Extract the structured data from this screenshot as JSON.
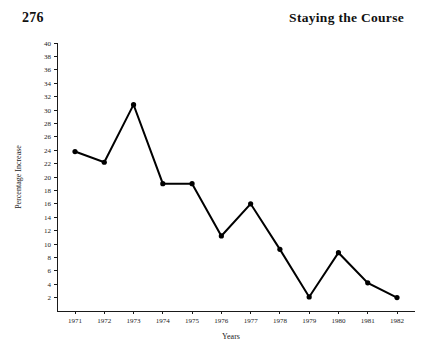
{
  "header": {
    "folio": "276",
    "running_head": "Staying the Course"
  },
  "chart_data": {
    "type": "line",
    "title": "",
    "xlabel": "Years",
    "ylabel": "Percentage Increase",
    "categories": [
      "1971",
      "1972",
      "1973",
      "1974",
      "1975",
      "1976",
      "1977",
      "1978",
      "1979",
      "1980",
      "1981",
      "1982"
    ],
    "values": [
      23.8,
      22.2,
      30.8,
      19.0,
      19.0,
      11.2,
      16.0,
      9.2,
      2.1,
      8.7,
      4.2,
      2.0
    ],
    "x": [
      1971,
      1972,
      1973,
      1974,
      1975,
      1976,
      1977,
      1978,
      1979,
      1980,
      1981,
      1982
    ],
    "ylim": [
      0,
      40
    ],
    "xlim": [
      1970.5,
      1982.5
    ],
    "ytick_labels": [
      "2",
      "4",
      "6",
      "8",
      "10",
      "12",
      "14",
      "16",
      "18",
      "20",
      "22",
      "24",
      "26",
      "28",
      "30",
      "32",
      "34",
      "36",
      "38",
      "40"
    ],
    "ytick_values": [
      2,
      4,
      6,
      8,
      10,
      12,
      14,
      16,
      18,
      20,
      22,
      24,
      26,
      28,
      30,
      32,
      34,
      36,
      38,
      40
    ],
    "ytick_step": 2,
    "grid": false,
    "legend": null,
    "marker": "filled-circle",
    "line_color": "#000000",
    "marker_color": "#000000"
  }
}
